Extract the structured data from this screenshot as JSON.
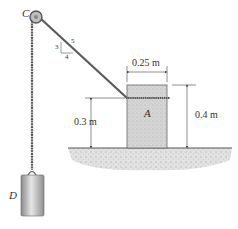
{
  "diagram": {
    "type": "statics-mechanics-figure",
    "labels": {
      "pulley": "C",
      "block": "A",
      "weight": "D",
      "width_dim": "0.25 m",
      "height_dim": "0.4 m",
      "rope_height_dim": "0.3 m",
      "slope_rise": "3",
      "slope_run": "4",
      "slope_hyp": "5"
    },
    "colors": {
      "rope": "#555555",
      "block_fill": "#d4d4d4",
      "block_edge": "#555555",
      "ground": "#cfcfcf",
      "weight_fill": "#b8b8b8",
      "dim_line": "#444444"
    }
  }
}
